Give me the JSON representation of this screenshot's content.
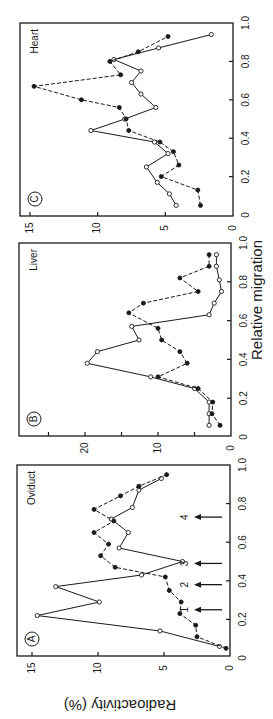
{
  "figure": {
    "ylabel": "Radioactivity (%)",
    "xlabel": "Relative migration"
  },
  "chart_data": [
    {
      "type": "line",
      "panel": "A",
      "title": "Oviduct",
      "xlabel": "Relative migration",
      "ylabel": "Radioactivity (%)",
      "xlim": [
        0,
        1.0
      ],
      "ylim": [
        0,
        16
      ],
      "xticks": [
        "0",
        "0.2",
        "0.4",
        "0.6",
        "0.8",
        "1.0"
      ],
      "yticks": [
        "0",
        "5",
        "10",
        "15"
      ],
      "grid": false,
      "orientation": "rotated 90° counter-clockwise",
      "series": [
        {
          "name": "open circles (solid line)",
          "marker": "open",
          "x": [
            0.06,
            0.14,
            0.22,
            0.29,
            0.37,
            0.43,
            0.5,
            0.57,
            0.65,
            0.72,
            0.78,
            0.87,
            0.93
          ],
          "values": [
            0.8,
            5.3,
            14.6,
            9.9,
            13.2,
            6.7,
            3.6,
            8.4,
            7.7,
            9.0,
            7.4,
            6.9,
            5.2
          ]
        },
        {
          "name": "filled circles (dashed line)",
          "marker": "filled",
          "x": [
            0.05,
            0.11,
            0.17,
            0.23,
            0.29,
            0.35,
            0.42,
            0.47,
            0.53,
            0.59,
            0.65,
            0.71,
            0.77,
            0.84,
            0.89,
            0.95
          ],
          "values": [
            0.3,
            2.5,
            2.6,
            3.8,
            3.7,
            4.6,
            4.9,
            8.7,
            9.8,
            9.2,
            10.3,
            8.8,
            10.3,
            8.3,
            6.9,
            4.8
          ]
        }
      ],
      "annotations": [
        {
          "label": "1",
          "x": 0.25,
          "type": "arrow"
        },
        {
          "label": "2",
          "x": 0.38,
          "type": "arrow"
        },
        {
          "label": "3",
          "x": 0.49,
          "type": "arrow"
        },
        {
          "label": "4",
          "x": 0.73,
          "type": "arrow"
        }
      ]
    },
    {
      "type": "line",
      "panel": "B",
      "title": "Liver",
      "xlabel": "Relative migration",
      "ylabel": "Radioactivity (%)",
      "xlim": [
        0,
        1.0
      ],
      "ylim": [
        0,
        27
      ],
      "xticks": [
        "0",
        "0.2",
        "0.4",
        "0.6",
        "0.8",
        "1.0"
      ],
      "yticks": [
        "0",
        "10",
        "20"
      ],
      "grid": false,
      "orientation": "rotated 90° counter-clockwise",
      "series": [
        {
          "name": "open circles (solid line)",
          "marker": "open",
          "x": [
            0.06,
            0.12,
            0.18,
            0.25,
            0.31,
            0.38,
            0.44,
            0.5,
            0.57,
            0.63,
            0.69,
            0.75,
            0.81,
            0.88,
            0.94
          ],
          "values": [
            3,
            3,
            3,
            5,
            11,
            19.7,
            18.3,
            12.6,
            13.6,
            3,
            2.3,
            1.3,
            1.6,
            2,
            2
          ]
        },
        {
          "name": "filled circles (dashed line)",
          "marker": "filled",
          "x": [
            0.06,
            0.12,
            0.18,
            0.25,
            0.31,
            0.38,
            0.44,
            0.5,
            0.56,
            0.64,
            0.69,
            0.75,
            0.82,
            0.88,
            0.94
          ],
          "values": [
            1.5,
            2.6,
            2.5,
            4.5,
            10,
            6,
            7,
            9.5,
            10,
            14,
            12,
            4.5,
            7,
            3,
            3
          ]
        }
      ]
    },
    {
      "type": "line",
      "panel": "C",
      "title": "Heart",
      "xlabel": "Relative migration",
      "ylabel": "Radioactivity (%)",
      "xlim": [
        0,
        1.0
      ],
      "ylim": [
        0,
        16
      ],
      "xticks": [
        "0",
        "0.2",
        "0.4",
        "0.6",
        "0.8",
        "1.0"
      ],
      "yticks": [
        "0",
        "5",
        "10",
        "15"
      ],
      "grid": false,
      "orientation": "rotated 90° counter-clockwise",
      "series": [
        {
          "name": "open circles (solid line)",
          "marker": "open",
          "x": [
            0.05,
            0.11,
            0.17,
            0.25,
            0.32,
            0.38,
            0.44,
            0.5,
            0.56,
            0.63,
            0.69,
            0.75,
            0.81,
            0.87,
            0.94
          ],
          "values": [
            4.2,
            4.7,
            5.6,
            6.4,
            4.8,
            5.8,
            10.5,
            8.0,
            5.7,
            6.8,
            7.5,
            6.8,
            8.8,
            5.5,
            1.6
          ]
        },
        {
          "name": "filled circles (dashed line)",
          "marker": "filled",
          "x": [
            0.05,
            0.13,
            0.2,
            0.26,
            0.33,
            0.38,
            0.44,
            0.5,
            0.56,
            0.6,
            0.67,
            0.73,
            0.8,
            0.85,
            0.93
          ],
          "values": [
            2.4,
            2.6,
            5.3,
            4.0,
            4.4,
            5.4,
            7.7,
            7.9,
            8.4,
            11.2,
            14.7,
            8.3,
            9.1,
            7.0,
            4.8
          ]
        }
      ]
    }
  ]
}
